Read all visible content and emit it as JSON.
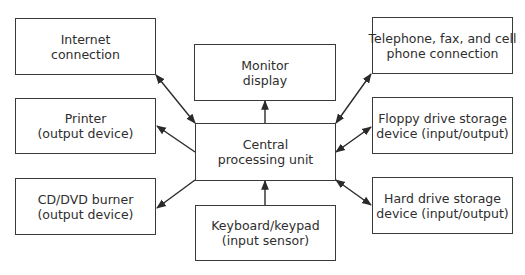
{
  "diagram": {
    "colors": {
      "stroke": "#3a3a3a",
      "text": "#2e2e2e",
      "background": "#ffffff"
    },
    "nodes": {
      "internet": {
        "line1": "Internet",
        "line2": "connection"
      },
      "printer": {
        "line1": "Printer",
        "line2": "(output device)"
      },
      "cddvd": {
        "line1": "CD/DVD burner",
        "line2": "(output device)"
      },
      "monitor": {
        "line1": "Monitor",
        "line2": "display"
      },
      "cpu": {
        "line1": "Central",
        "line2": "processing unit"
      },
      "keyboard": {
        "line1": "Keyboard/keypad",
        "line2": "(input sensor)"
      },
      "telephone": {
        "line1": "Telephone, fax, and cell",
        "line2": "phone connection"
      },
      "floppy": {
        "line1": "Floppy drive storage",
        "line2": "device (input/output)"
      },
      "harddrive": {
        "line1": "Hard drive storage",
        "line2": "device (input/output)"
      }
    },
    "edges": [
      {
        "from": "cpu",
        "to": "internet",
        "direction": "bidirectional"
      },
      {
        "from": "cpu",
        "to": "printer",
        "direction": "to"
      },
      {
        "from": "cpu",
        "to": "cddvd",
        "direction": "to"
      },
      {
        "from": "cpu",
        "to": "monitor",
        "direction": "to"
      },
      {
        "from": "keyboard",
        "to": "cpu",
        "direction": "to"
      },
      {
        "from": "cpu",
        "to": "telephone",
        "direction": "bidirectional"
      },
      {
        "from": "cpu",
        "to": "floppy",
        "direction": "bidirectional"
      },
      {
        "from": "cpu",
        "to": "harddrive",
        "direction": "bidirectional"
      }
    ]
  }
}
